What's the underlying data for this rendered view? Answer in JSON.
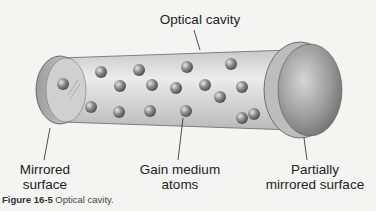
{
  "labels": {
    "top": "Optical cavity",
    "left_line1": "Mirrored",
    "left_line2": "surface",
    "center_line1": "Gain medium",
    "center_line2": "atoms",
    "right_line1": "Partially",
    "right_line2": "mirrored surface"
  },
  "caption": {
    "figure": "Figure 16-5",
    "text": "Optical cavity."
  }
}
